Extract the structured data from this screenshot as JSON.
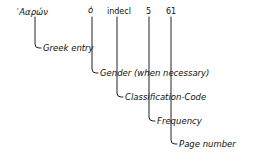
{
  "entry": {
    "greek_word": "᾿Ααρών",
    "gender": "ὁ",
    "classification": "indecl",
    "frequency": "5",
    "page": "61"
  },
  "labels": {
    "greek_entry": "Greek entry",
    "gender": "Gender (when necessary)",
    "classification": "Classification-Code",
    "frequency": "Frequency",
    "page": "Page number"
  },
  "colors": {
    "ink": "#111111",
    "background": "#ffffff"
  }
}
